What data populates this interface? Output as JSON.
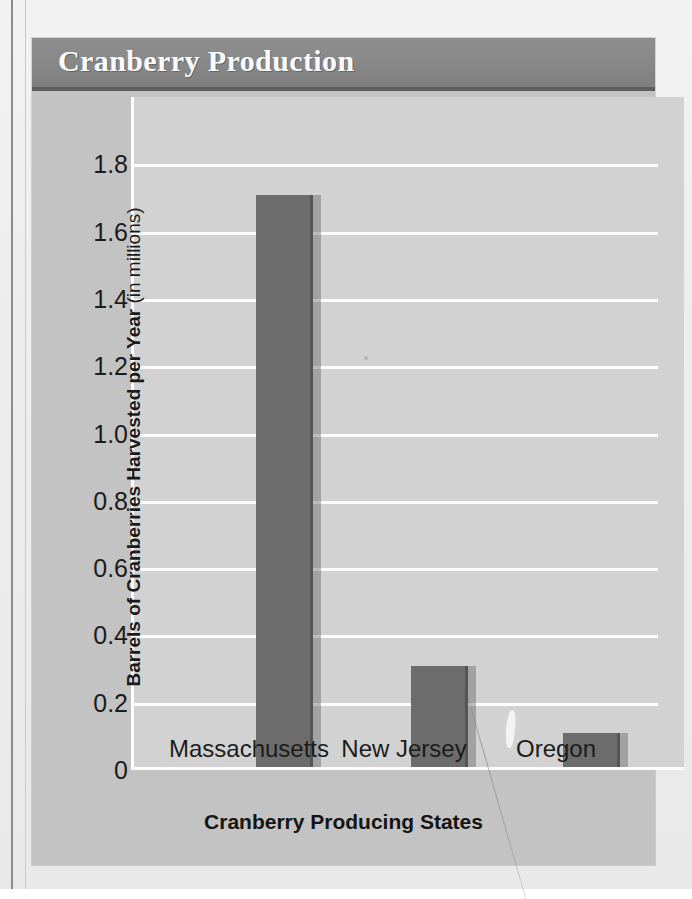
{
  "chart_data": {
    "type": "bar",
    "title": "Cranberry Production",
    "categories": [
      "Massachusetts",
      "New Jersey",
      "Oregon"
    ],
    "values": [
      1.7,
      0.3,
      0.1
    ],
    "xlabel": "Cranberry Producing States",
    "ylabel": "Barrels of Cranberries Harvested per Year (in millions)",
    "ylabel_bold_part": "Barrels of Cranberries Harvested per Year",
    "ylabel_light_part": "(in millions)",
    "yticks": [
      "1.8",
      "1.6",
      "1.4",
      "1.2",
      "1.0",
      "0.8",
      "0.6",
      "0.4",
      "0.2",
      "0"
    ],
    "ytick_values": [
      1.8,
      1.6,
      1.4,
      1.2,
      1.0,
      0.8,
      0.6,
      0.4,
      0.2,
      0
    ],
    "ylim": [
      0,
      2.0
    ],
    "grid": true,
    "legend": "none",
    "bar_color": "#6c6c6c",
    "plot_background": "#d2d2d2",
    "gridline_color": "#fdfdfd",
    "header_color": "#878787",
    "card_background": "#c3c3c3",
    "title_color": "#fbfbfb"
  }
}
